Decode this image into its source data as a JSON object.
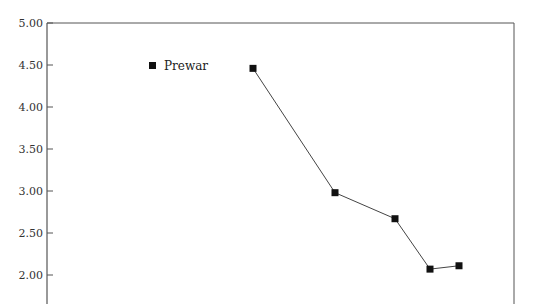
{
  "chart_data": {
    "type": "line",
    "title": "",
    "xlabel": "",
    "ylabel": "",
    "ylim": [
      1.75,
      5.0
    ],
    "yticks": [
      "5.00",
      "4.50",
      "4.00",
      "3.50",
      "3.00",
      "2.50",
      "2.00"
    ],
    "ytick_values": [
      5.0,
      4.5,
      4.0,
      3.5,
      3.0,
      2.5,
      2.0
    ],
    "grid": false,
    "legend_position": "upper-left inside plot",
    "series": [
      {
        "name": "Prewar",
        "marker": "square",
        "color": "#111111",
        "x_px": [
          253,
          335,
          395,
          430,
          459
        ],
        "values": [
          4.46,
          2.98,
          2.67,
          2.07,
          2.11
        ]
      }
    ]
  },
  "legend": {
    "label": "Prewar"
  },
  "colors": {
    "axis": "#555555",
    "line": "#444444",
    "marker": "#111111"
  }
}
